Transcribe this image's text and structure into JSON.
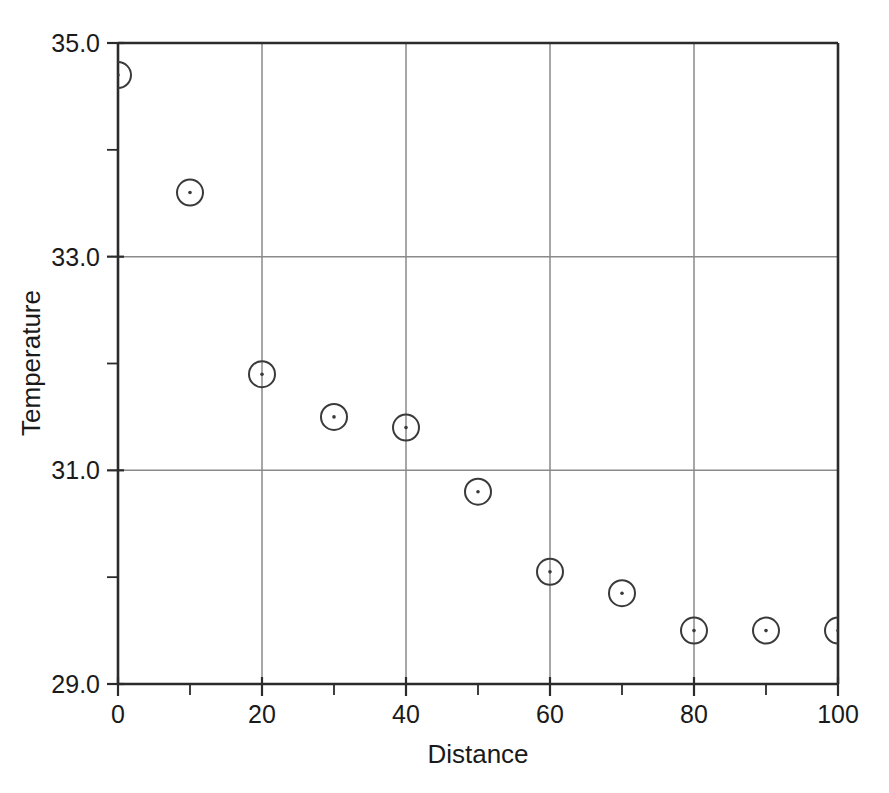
{
  "chart_data": {
    "type": "scatter",
    "title": "",
    "xlabel": "Distance",
    "ylabel": "Temperature",
    "xlim": [
      0,
      100
    ],
    "ylim": [
      29.0,
      35.0
    ],
    "grid": true,
    "legend": "none",
    "marker": "open-circle-with-center-dot",
    "x_major_ticks": [
      0,
      20,
      40,
      60,
      80,
      100
    ],
    "x_major_tick_labels": [
      "0",
      "20",
      "40",
      "60",
      "80",
      "100"
    ],
    "x_minor_ticks": [
      10,
      30,
      50,
      70,
      90
    ],
    "y_major_ticks": [
      29.0,
      31.0,
      33.0,
      35.0
    ],
    "y_major_tick_labels": [
      "29.0",
      "31.0",
      "33.0",
      "35.0"
    ],
    "y_minor_ticks": [
      30.0,
      32.0,
      34.0
    ],
    "x": [
      0,
      10,
      20,
      30,
      40,
      50,
      60,
      70,
      80,
      90,
      100
    ],
    "values": [
      34.7,
      33.6,
      31.9,
      31.5,
      31.4,
      30.8,
      30.05,
      29.85,
      29.5,
      29.5,
      29.5
    ],
    "points": [
      {
        "x": 0,
        "y": 34.7
      },
      {
        "x": 10,
        "y": 33.6
      },
      {
        "x": 20,
        "y": 31.9
      },
      {
        "x": 30,
        "y": 31.5
      },
      {
        "x": 40,
        "y": 31.4
      },
      {
        "x": 50,
        "y": 30.8
      },
      {
        "x": 60,
        "y": 30.05
      },
      {
        "x": 70,
        "y": 29.85
      },
      {
        "x": 80,
        "y": 29.5
      },
      {
        "x": 90,
        "y": 29.5
      },
      {
        "x": 100,
        "y": 29.5
      }
    ],
    "colors": {
      "marker_stroke": "#3a3a3a",
      "axis": "#2b2b2b",
      "grid": "#8a8a8a",
      "background": "#ffffff",
      "text": "#1a1a1a"
    }
  },
  "figure": {
    "width": 889,
    "height": 793,
    "plot_left": 118,
    "plot_right": 838,
    "plot_top": 43,
    "plot_bottom": 684,
    "marker_radius": 13,
    "dot_radius": 1.8
  }
}
